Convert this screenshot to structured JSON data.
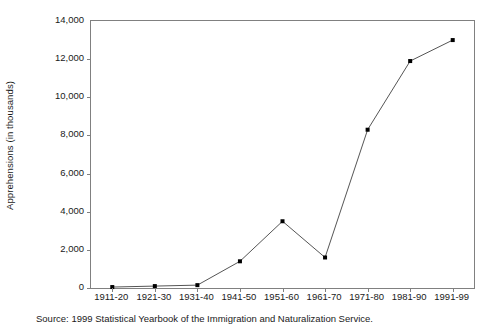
{
  "chart_data": {
    "type": "line",
    "title": "",
    "subtitle": "",
    "xlabel": "",
    "ylabel": "Apprehensions (in thousands)",
    "categories": [
      "1911-20",
      "1921-30",
      "1931-40",
      "1941-50",
      "1951-60",
      "1961-70",
      "1971-80",
      "1981-90",
      "1991-99"
    ],
    "values": [
      50,
      100,
      150,
      1400,
      3500,
      1600,
      8300,
      11900,
      13000
    ],
    "series": [
      {
        "name": "Apprehensions",
        "values": [
          50,
          100,
          150,
          1400,
          3500,
          1600,
          8300,
          11900,
          13000
        ]
      }
    ],
    "ylim": [
      0,
      14000
    ],
    "ytick_values": [
      0,
      2000,
      4000,
      6000,
      8000,
      10000,
      12000,
      14000
    ],
    "ytick_labels": [
      "0",
      "2,000",
      "4,000",
      "6,000",
      "8,000",
      "10,000",
      "12,000",
      "14,000"
    ],
    "grid": false,
    "legend": "none",
    "marker": "square",
    "line_color": "#555555",
    "marker_color": "#000000",
    "axis_color": "#808080",
    "background_color": "#ffffff"
  },
  "source": {
    "text": "Source: 1999 Statistical Yearbook of the Immigration and Naturalization Service."
  }
}
